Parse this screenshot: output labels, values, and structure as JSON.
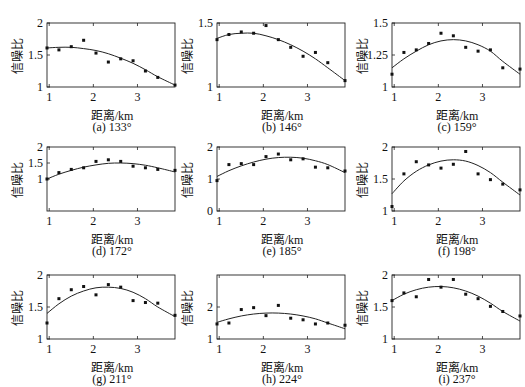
{
  "chart_data": [
    {
      "type": "scatter",
      "title": "(a) 133°",
      "xlabel": "距离/km",
      "ylabel": "信噪比",
      "xlim": [
        0.95,
        3.85
      ],
      "ylim": [
        1,
        2
      ],
      "yticks": [
        1,
        1.5,
        2
      ],
      "xticks": [
        1,
        2,
        3
      ],
      "points_x": [
        0.95,
        1.22,
        1.5,
        1.78,
        2.06,
        2.34,
        2.62,
        2.9,
        3.18,
        3.46,
        3.85
      ],
      "points_y": [
        1.61,
        1.58,
        1.63,
        1.73,
        1.53,
        1.39,
        1.44,
        1.41,
        1.25,
        1.15,
        1.03
      ],
      "fit_y": [
        1.61,
        1.62,
        1.62,
        1.6,
        1.57,
        1.52,
        1.45,
        1.37,
        1.27,
        1.16,
        1.03
      ]
    },
    {
      "type": "scatter",
      "title": "(b) 146°",
      "xlabel": "距离/km",
      "ylabel": "信噪比",
      "xlim": [
        0.95,
        3.85
      ],
      "ylim": [
        1,
        1.5
      ],
      "yticks": [
        1,
        1.5
      ],
      "xticks": [
        1,
        2,
        3
      ],
      "points_x": [
        0.95,
        1.22,
        1.5,
        1.78,
        2.06,
        2.34,
        2.62,
        2.9,
        3.18,
        3.46,
        3.85
      ],
      "points_y": [
        1.37,
        1.41,
        1.43,
        1.42,
        1.48,
        1.37,
        1.31,
        1.24,
        1.27,
        1.19,
        1.05
      ],
      "fit_y": [
        1.38,
        1.41,
        1.42,
        1.42,
        1.4,
        1.37,
        1.33,
        1.28,
        1.22,
        1.15,
        1.05
      ]
    },
    {
      "type": "scatter",
      "title": "(c) 159°",
      "xlabel": "距离/km",
      "ylabel": "信噪比",
      "xlim": [
        0.95,
        3.85
      ],
      "ylim": [
        1,
        1.5
      ],
      "yticks": [
        1,
        1.25,
        1.5
      ],
      "xticks": [
        1,
        2,
        3
      ],
      "points_x": [
        0.95,
        1.22,
        1.5,
        1.78,
        2.06,
        2.34,
        2.62,
        2.9,
        3.18,
        3.46,
        3.85
      ],
      "points_y": [
        1.1,
        1.27,
        1.29,
        1.34,
        1.42,
        1.4,
        1.31,
        1.28,
        1.29,
        1.15,
        1.14
      ],
      "fit_y": [
        1.15,
        1.22,
        1.28,
        1.33,
        1.36,
        1.37,
        1.36,
        1.33,
        1.28,
        1.2,
        1.1
      ]
    },
    {
      "type": "scatter",
      "title": "(d) 172°",
      "xlabel": "距离/km",
      "ylabel": "信噪比",
      "xlim": [
        0.95,
        3.85
      ],
      "ylim": [
        0,
        2
      ],
      "yticks": [
        1,
        1.5,
        2
      ],
      "xticks": [
        1,
        2,
        3
      ],
      "points_x": [
        0.95,
        1.22,
        1.5,
        1.78,
        2.06,
        2.34,
        2.62,
        2.9,
        3.18,
        3.46,
        3.85
      ],
      "points_y": [
        1.0,
        1.2,
        1.3,
        1.35,
        1.55,
        1.6,
        1.55,
        1.4,
        1.35,
        1.3,
        1.27
      ],
      "fit_y": [
        1.0,
        1.15,
        1.27,
        1.37,
        1.44,
        1.49,
        1.5,
        1.48,
        1.43,
        1.35,
        1.22
      ]
    },
    {
      "type": "scatter",
      "title": "(e) 185°",
      "xlabel": "距离/km",
      "ylabel": "信噪比",
      "xlim": [
        0.95,
        3.85
      ],
      "ylim": [
        0,
        2
      ],
      "yticks": [
        0,
        1,
        2
      ],
      "xticks": [
        1,
        2,
        3
      ],
      "points_x": [
        0.95,
        1.22,
        1.5,
        1.78,
        2.06,
        2.34,
        2.62,
        2.9,
        3.18,
        3.46,
        3.85
      ],
      "points_y": [
        0.95,
        1.45,
        1.48,
        1.45,
        1.7,
        1.78,
        1.6,
        1.63,
        1.37,
        1.35,
        1.25
      ],
      "fit_y": [
        1.08,
        1.26,
        1.41,
        1.53,
        1.62,
        1.67,
        1.68,
        1.65,
        1.57,
        1.45,
        1.2
      ]
    },
    {
      "type": "scatter",
      "title": "(f) 198°",
      "xlabel": "距离/km",
      "ylabel": "信噪比",
      "xlim": [
        0.95,
        3.85
      ],
      "ylim": [
        1,
        2
      ],
      "yticks": [
        1,
        1.5,
        2
      ],
      "xticks": [
        1,
        2,
        3
      ],
      "points_x": [
        0.95,
        1.22,
        1.5,
        1.78,
        2.06,
        2.34,
        2.62,
        2.9,
        3.18,
        3.46,
        3.85
      ],
      "points_y": [
        1.07,
        1.58,
        1.77,
        1.72,
        1.67,
        1.73,
        1.93,
        1.58,
        1.49,
        1.42,
        1.33
      ],
      "fit_y": [
        1.27,
        1.47,
        1.62,
        1.72,
        1.78,
        1.8,
        1.78,
        1.71,
        1.6,
        1.45,
        1.25
      ]
    },
    {
      "type": "scatter",
      "title": "(g) 211°",
      "xlabel": "距离/km",
      "ylabel": "信噪比",
      "xlim": [
        0.95,
        3.85
      ],
      "ylim": [
        1,
        2
      ],
      "yticks": [
        1,
        1.5,
        2
      ],
      "xticks": [
        1,
        2,
        3
      ],
      "points_x": [
        0.95,
        1.22,
        1.5,
        1.78,
        2.06,
        2.34,
        2.62,
        2.9,
        3.18,
        3.46,
        3.85
      ],
      "points_y": [
        1.25,
        1.63,
        1.77,
        1.82,
        1.69,
        1.85,
        1.81,
        1.6,
        1.57,
        1.56,
        1.37
      ],
      "fit_y": [
        1.4,
        1.55,
        1.67,
        1.75,
        1.8,
        1.81,
        1.79,
        1.73,
        1.63,
        1.5,
        1.35
      ]
    },
    {
      "type": "scatter",
      "title": "(h) 224°",
      "xlabel": "距离/km",
      "ylabel": "信噪比",
      "xlim": [
        0.95,
        3.85
      ],
      "ylim": [
        1,
        3
      ],
      "yticks": [
        1,
        2
      ],
      "xticks": [
        1,
        2,
        3
      ],
      "points_x": [
        0.95,
        1.22,
        1.5,
        1.78,
        2.06,
        2.34,
        2.62,
        2.9,
        3.18,
        3.46,
        3.85
      ],
      "points_y": [
        1.47,
        1.5,
        1.92,
        1.98,
        1.73,
        2.05,
        1.65,
        1.6,
        1.47,
        1.5,
        1.43
      ],
      "fit_y": [
        1.52,
        1.63,
        1.72,
        1.78,
        1.81,
        1.81,
        1.78,
        1.72,
        1.63,
        1.5,
        1.32
      ]
    },
    {
      "type": "scatter",
      "title": "(i) 237°",
      "xlabel": "距离/km",
      "ylabel": "信噪比",
      "xlim": [
        0.95,
        3.85
      ],
      "ylim": [
        1,
        2
      ],
      "yticks": [
        1,
        1.5,
        2
      ],
      "xticks": [
        1,
        2,
        3
      ],
      "points_x": [
        0.95,
        1.22,
        1.5,
        1.78,
        2.06,
        2.34,
        2.62,
        2.9,
        3.18,
        3.46,
        3.85
      ],
      "points_y": [
        1.6,
        1.72,
        1.66,
        1.93,
        1.81,
        1.93,
        1.7,
        1.63,
        1.51,
        1.43,
        1.36
      ],
      "fit_y": [
        1.6,
        1.7,
        1.77,
        1.81,
        1.82,
        1.8,
        1.75,
        1.67,
        1.56,
        1.43,
        1.28
      ]
    }
  ]
}
